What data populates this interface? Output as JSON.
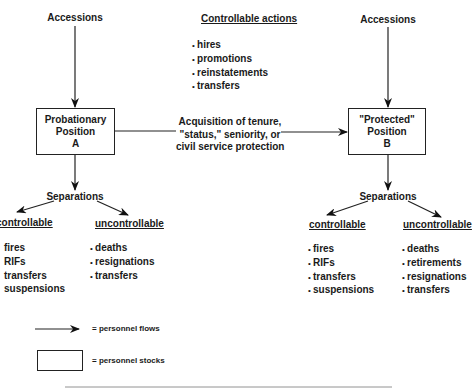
{
  "diagram": {
    "left": {
      "accessions_label": "Accessions",
      "box": {
        "line1": "Probationary",
        "line2": "Position",
        "line3": "A"
      },
      "separations_label": "Separations",
      "controllable": {
        "heading": "controllable",
        "items": [
          "fires",
          "RIFs",
          "transfers",
          "suspensions"
        ]
      },
      "uncontrollable": {
        "heading": "uncontrollable",
        "items": [
          "deaths",
          "resignations",
          "transfers"
        ]
      }
    },
    "center": {
      "controllable_actions": {
        "heading": "Controllable actions",
        "items": [
          "hires",
          "promotions",
          "reinstatements",
          "transfers"
        ]
      },
      "transition": {
        "line1": "Acquisition of tenure,",
        "line2": "\"status,\" seniority, or",
        "line3": "civil service protection"
      }
    },
    "right": {
      "accessions_label": "Accessions",
      "box": {
        "line1": "\"Protected\"",
        "line2": "Position",
        "line3": "B"
      },
      "separations_label": "Separations",
      "controllable": {
        "heading": "controllable",
        "items": [
          "fires",
          "RIFs",
          "transfers",
          "suspensions"
        ]
      },
      "uncontrollable": {
        "heading": "uncontrollable",
        "items": [
          "deaths",
          "retirements",
          "resignations",
          "transfers"
        ]
      }
    },
    "legend": {
      "flows_label": "= personnel flows",
      "stocks_label": "= personnel stocks"
    }
  }
}
